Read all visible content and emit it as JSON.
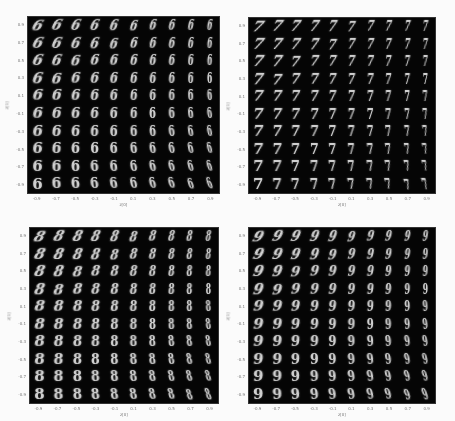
{
  "chart_data": [
    {
      "type": "heatmap",
      "title": "",
      "description": "10x10 grid of generated digit images (latent space manifold)",
      "digit": "6",
      "xlabel": "z[0]",
      "ylabel": "z[1]",
      "rows": 10,
      "cols": 10,
      "grid": false
    },
    {
      "type": "heatmap",
      "title": "",
      "description": "10x10 grid of generated digit images (latent space manifold)",
      "digit": "7",
      "xlabel": "z[0]",
      "ylabel": "z[1]",
      "rows": 10,
      "cols": 10,
      "grid": false
    },
    {
      "type": "heatmap",
      "title": "",
      "description": "10x10 grid of generated digit images (latent space manifold)",
      "digit": "8",
      "xlabel": "z[0]",
      "ylabel": "z[1]",
      "rows": 10,
      "cols": 10,
      "grid": false
    },
    {
      "type": "heatmap",
      "title": "",
      "description": "10x10 grid of generated digit images (latent space manifold)",
      "digit": "9",
      "xlabel": "z[0]",
      "ylabel": "z[1]",
      "rows": 10,
      "cols": 10,
      "grid": false
    }
  ],
  "axes": {
    "xticks": [
      "-0.9",
      "-0.7",
      "-0.5",
      "-0.3",
      "-0.1",
      "0.1",
      "0.3",
      "0.5",
      "0.7",
      "0.9"
    ],
    "yticks": [
      "0.9",
      "0.7",
      "0.5",
      "0.3",
      "0.1",
      "-0.1",
      "-0.3",
      "-0.5",
      "-0.7",
      "-0.9"
    ],
    "xlabel": "z[0]",
    "ylabel": "z[1]"
  },
  "panels": [
    {
      "digit": "6",
      "x": 27,
      "y": 16,
      "w": 193,
      "h": 178
    },
    {
      "digit": "7",
      "x": 248,
      "y": 17,
      "w": 188,
      "h": 177
    },
    {
      "digit": "8",
      "x": 29,
      "y": 227,
      "w": 190,
      "h": 177
    },
    {
      "digit": "9",
      "x": 248,
      "y": 227,
      "w": 188,
      "h": 177
    }
  ]
}
